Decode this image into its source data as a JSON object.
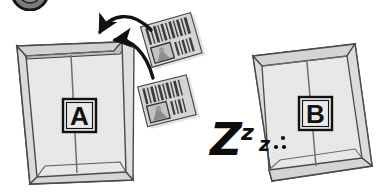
{
  "figure": {
    "type": "instructional-line-diagram",
    "background_color": "#ffffff",
    "stroke_color": "#3a3a3a",
    "ink_color": "#111111",
    "envelope_fill": "#e8e8e8",
    "envelope_shade": "#d8d8d8",
    "card_fill": "#d4d4d4",
    "card_stripe": "#4a4a4a"
  },
  "top_left_fragment": {
    "name": "cropped-circle-fragment",
    "fill": "#6f6f6f",
    "stroke": "#1a1a1a"
  },
  "envelope_a": {
    "label": "A",
    "state": "open",
    "description": "open envelope receiving cards"
  },
  "envelope_b": {
    "label": "B",
    "state": "sealed",
    "description": "sealed envelope at rest"
  },
  "cards": [
    {
      "name": "barcode-card-upper",
      "stripes": 11,
      "has_photo_box": true
    },
    {
      "name": "barcode-card-lower",
      "stripes": 10,
      "has_photo_box": true
    }
  ],
  "arrows": [
    {
      "name": "insert-arrow-outer",
      "direction": "into-envelope-a"
    },
    {
      "name": "insert-arrow-inner",
      "direction": "into-envelope-a"
    }
  ],
  "sleep_marks": {
    "z_large": "Z",
    "z_medium": "z",
    "z_small": "z",
    "dots": "···"
  }
}
